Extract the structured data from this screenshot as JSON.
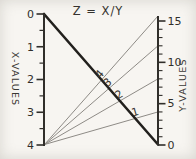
{
  "chart_data": {
    "type": "line",
    "variant": "nomogram",
    "title": "Z = X/Y",
    "left_axis": {
      "label": "X-VALUES",
      "min": 0,
      "max": 4,
      "major_ticks": [
        0,
        1,
        2,
        3,
        4
      ],
      "minor_ticks": [
        0.5,
        1.5,
        2.5,
        3.5
      ],
      "direction": "increases-downward"
    },
    "right_axis": {
      "label": "Y-VALUES",
      "min": 0,
      "max": 15,
      "major_ticks": [
        15,
        10,
        5,
        0
      ],
      "minor_step": 1,
      "direction": "increases-upward"
    },
    "index_line": {
      "from": "left-axis X=0 (top)",
      "to": "right-axis Y=0 (bottom)",
      "style": "thick"
    },
    "z_lines": [
      {
        "label": "4",
        "origin": "left-axis X=4",
        "end_y_value": 16
      },
      {
        "label": "3",
        "origin": "left-axis X=4",
        "end_y_value": 12
      },
      {
        "label": "2",
        "origin": "left-axis X=4",
        "end_y_value": 8
      },
      {
        "label": "1",
        "origin": "left-axis X=4",
        "end_y_value": 4
      }
    ]
  },
  "colors": {
    "ink": "#302e2a",
    "index_line": "#22201d",
    "thin_line": "#8e8b86",
    "background": "#f7f5f1"
  }
}
